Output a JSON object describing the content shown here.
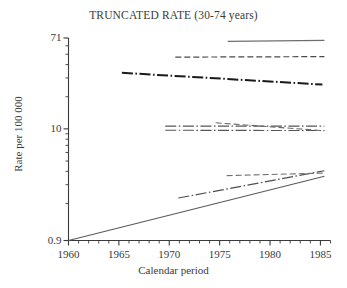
{
  "chart_data": {
    "type": "line",
    "title": "TRUNCATED RATE (30-74 years)",
    "xlabel": "Calendar period",
    "ylabel": "Rate per 100 000",
    "yscale": "log",
    "ylim": [
      0.9,
      71
    ],
    "xlim": [
      1960,
      1986
    ],
    "grid": false,
    "legend": "none",
    "ytick_labels": [
      "71",
      "10",
      "0.9"
    ],
    "ytick_values": [
      71,
      10,
      0.9
    ],
    "yminor_ticks": [
      60,
      50,
      40,
      30,
      20,
      9,
      8,
      7,
      6,
      5,
      4,
      3,
      2
    ],
    "xtick_labels": [
      "1960",
      "1965",
      "1970",
      "1975",
      "1980",
      "1985"
    ],
    "xtick_values": [
      1960,
      1965,
      1970,
      1975,
      1980,
      1985
    ],
    "xminor_ticks": [
      1961,
      1962,
      1963,
      1964,
      1966,
      1967,
      1968,
      1969,
      1971,
      1972,
      1973,
      1974,
      1976,
      1977,
      1978,
      1979,
      1981,
      1982,
      1983,
      1984,
      1986
    ],
    "series": [
      {
        "name": "series-1-top-solid",
        "style": "solid",
        "color": "#6e6e6e",
        "width": 1.1,
        "x": [
          1975.8,
          1985.4
        ],
        "y": [
          66.0,
          67.5
        ]
      },
      {
        "name": "series-2-upper-dashed",
        "style": "dashed",
        "color": "#4a4a4a",
        "width": 1.2,
        "x": [
          1970.6,
          1985.4
        ],
        "y": [
          47.0,
          47.5
        ]
      },
      {
        "name": "series-3-thick-dashdot",
        "style": "dashdot",
        "color": "#1a1a1a",
        "width": 2.0,
        "x": [
          1965.3,
          1985.2
        ],
        "y": [
          33.5,
          26.0
        ]
      },
      {
        "name": "series-4-mid-upper-dashdot",
        "style": "dashdot",
        "color": "#565656",
        "width": 1.1,
        "x": [
          1969.6,
          1985.4
        ],
        "y": [
          10.6,
          10.6
        ]
      },
      {
        "name": "series-5-mid-lower-dashdot",
        "style": "dashdot",
        "color": "#565656",
        "width": 1.1,
        "x": [
          1969.6,
          1985.4
        ],
        "y": [
          9.7,
          9.65
        ]
      },
      {
        "name": "series-6-mid-descending-dashed",
        "style": "dashed",
        "color": "#6a6a6a",
        "width": 1.1,
        "x": [
          1974.6,
          1985.4
        ],
        "y": [
          11.4,
          9.6
        ]
      },
      {
        "name": "series-7-low-rising-dashdot",
        "style": "dashdot",
        "color": "#4f4f4f",
        "width": 1.2,
        "x": [
          1970.9,
          1985.4
        ],
        "y": [
          2.25,
          4.05
        ]
      },
      {
        "name": "series-8-low-dashed-flat",
        "style": "dashed",
        "color": "#707070",
        "width": 1.1,
        "x": [
          1975.7,
          1985.3
        ],
        "y": [
          3.65,
          3.85
        ]
      },
      {
        "name": "series-9-long-solid-rising",
        "style": "solid",
        "color": "#5a5a5a",
        "width": 1.1,
        "x": [
          1960.0,
          1985.4
        ],
        "y": [
          0.9,
          3.6
        ]
      }
    ]
  }
}
